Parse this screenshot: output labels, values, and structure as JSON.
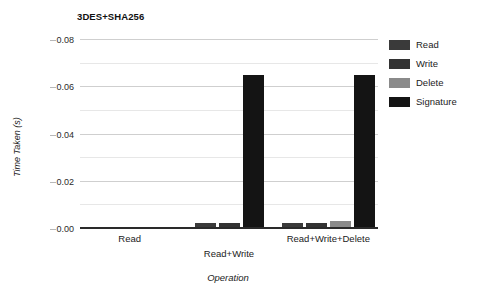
{
  "chart_data": {
    "type": "bar",
    "title": "3DES+SHA256",
    "xlabel": "Operation",
    "ylabel": "Time Taken (s)",
    "categories": [
      "Read",
      "Read+Write",
      "Read+Write+Delete"
    ],
    "series": [
      {
        "name": "Read",
        "color": "#3a3a3a",
        "values": [
          0.0008,
          0.0026,
          0.0026
        ]
      },
      {
        "name": "Write",
        "color": "#333333",
        "values": [
          0.0008,
          0.0026,
          0.0026
        ]
      },
      {
        "name": "Delete",
        "color": "#8a8a8a",
        "values": [
          null,
          null,
          0.0035
        ]
      },
      {
        "name": "Signature",
        "color": "#141414",
        "values": [
          null,
          0.065,
          0.065
        ]
      }
    ],
    "ylim": [
      0,
      0.08
    ],
    "yticks": [
      "0.00",
      "0.02",
      "0.04",
      "0.06",
      "0.08"
    ],
    "ytick_values": [
      0,
      0.02,
      0.04,
      0.06,
      0.08
    ],
    "grid": true,
    "legend_position": "right"
  },
  "legend": {
    "entries": [
      {
        "label": "Read",
        "color": "#3a3a3a"
      },
      {
        "label": "Write",
        "color": "#333333"
      },
      {
        "label": "Delete",
        "color": "#8a8a8a"
      },
      {
        "label": "Signature",
        "color": "#141414"
      }
    ]
  }
}
